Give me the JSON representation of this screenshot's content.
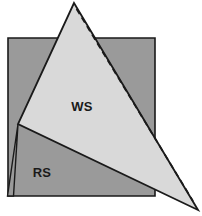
{
  "figure": {
    "canvas": {
      "width": 202,
      "height": 216,
      "background": "#ffffff"
    },
    "colors": {
      "background": "#ffffff",
      "reference_surface_fill": "#9a9a9a",
      "working_surface_fill": "#d9d9d9",
      "outline": "#1a1a1a",
      "dashed_line": "#1a1a1a",
      "label_text": "#1a1a1a"
    },
    "shapes": [
      {
        "id": "reference-surface",
        "name": "RS",
        "type": "square",
        "fill": "#9a9a9a",
        "stroke": "#1a1a1a",
        "points": "8,38 155,38 155,196 8,196"
      },
      {
        "id": "working-surface",
        "name": "WS",
        "type": "triangle",
        "fill": "#d9d9d9",
        "stroke": "#1a1a1a",
        "points": "74,3 198,210 18,124"
      },
      {
        "id": "sliver-wedge",
        "type": "thin-wedge",
        "fill": "#9a9a9a",
        "stroke": "#1a1a1a",
        "points": "18,124 12,196 7,196"
      }
    ],
    "dashed_edge": {
      "id": "dashed-reference-edge",
      "from": "76,8",
      "to": "194,203",
      "dash_pattern": "6,4",
      "stroke": "#1a1a1a",
      "width": 1.6
    },
    "labels": [
      {
        "id": "label-ws",
        "text": "WS",
        "x": 82,
        "y": 111,
        "anchor": "middle"
      },
      {
        "id": "label-rs",
        "text": "RS",
        "x": 42,
        "y": 177,
        "anchor": "middle"
      }
    ]
  }
}
